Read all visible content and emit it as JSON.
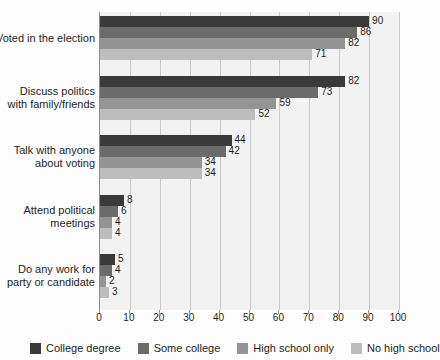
{
  "chart_data": {
    "type": "bar",
    "orientation": "horizontal",
    "title": "",
    "xlabel": "",
    "ylabel": "",
    "xlim": [
      0,
      100
    ],
    "xticks": [
      0,
      10,
      20,
      30,
      40,
      50,
      60,
      70,
      80,
      90,
      100
    ],
    "grid": true,
    "legend_position": "bottom",
    "categories": [
      "Voted in the election",
      "Discuss politics with family/friends",
      "Talk with anyone about voting",
      "Attend political meetings",
      "Do any work for party or candidate"
    ],
    "category_lines": [
      [
        "Voted in the election"
      ],
      [
        "Discuss politics",
        "with family/friends"
      ],
      [
        "Talk with anyone",
        "about voting"
      ],
      [
        "Attend political",
        "meetings"
      ],
      [
        "Do any work for",
        "party or candidate"
      ]
    ],
    "series": [
      {
        "name": "College degree",
        "color": "#3a3a3a",
        "values": [
          90,
          82,
          44,
          8,
          5
        ]
      },
      {
        "name": "Some college",
        "color": "#6b6b6b",
        "values": [
          86,
          73,
          42,
          6,
          4
        ]
      },
      {
        "name": "High school only",
        "color": "#949494",
        "values": [
          82,
          59,
          34,
          4,
          2
        ]
      },
      {
        "name": "No high school",
        "color": "#bdbdbd",
        "values": [
          71,
          52,
          34,
          4,
          3
        ]
      }
    ]
  },
  "colors": {
    "plot_background": "#f2f2f2",
    "page_background": "#fdfdfd",
    "gridline": "#c9c9c9",
    "axis": "#8e8e8e",
    "text": "#1d1d1d"
  }
}
